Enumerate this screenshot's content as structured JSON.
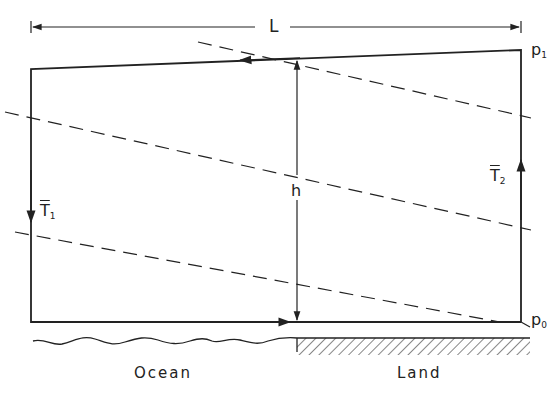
{
  "diagram": {
    "type": "sea-breeze circulation schematic",
    "labels": {
      "length": "L",
      "height": "h",
      "pressure_top": {
        "base": "p",
        "sub": "1"
      },
      "pressure_bottom": {
        "base": "p",
        "sub": "0"
      },
      "temp_left": {
        "base": "T",
        "sub": "1",
        "overbar": true
      },
      "temp_right": {
        "base": "T",
        "sub": "2",
        "overbar": true
      },
      "ocean": "Ocean",
      "land": "Land"
    },
    "colors": {
      "line": "#222222",
      "background": "#ffffff"
    },
    "elements": {
      "circulation_loop": "closed circuit: surface flow ocean→land, rising over land, return flow aloft land→ocean, sinking over ocean",
      "isobars_dashed": 3,
      "surface_left": "wavy water surface",
      "surface_right": "hatched ground"
    }
  }
}
